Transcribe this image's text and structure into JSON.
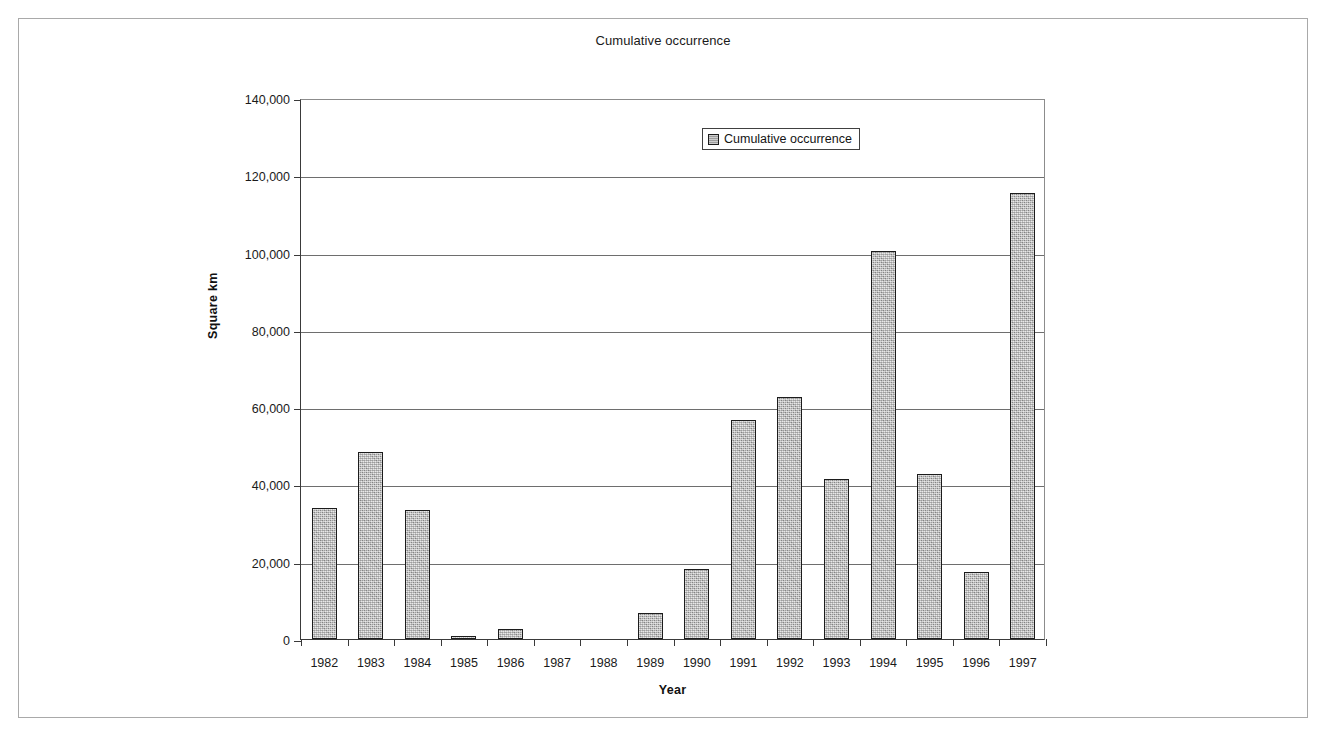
{
  "figure": {
    "title": "Cumulative occurrence"
  },
  "legend": {
    "position": "top-center",
    "entries": [
      {
        "label": "Cumulative occurrence",
        "swatch": "gray-textured-square"
      }
    ]
  },
  "axes": {
    "x_title": "Year",
    "y_title": "Square km"
  },
  "chart_data": {
    "type": "bar",
    "title": "Cumulative occurrence",
    "xlabel": "Year",
    "ylabel": "Square km",
    "series_name": "Cumulative occurrence",
    "grid": true,
    "legend_position": "top-center",
    "ylim": [
      0,
      140000
    ],
    "yticks": [
      0,
      20000,
      40000,
      60000,
      80000,
      100000,
      120000,
      140000
    ],
    "ytick_labels": [
      "0",
      "20,000",
      "40,000",
      "60,000",
      "80,000",
      "100,000",
      "120,000",
      "140,000"
    ],
    "categories": [
      "1982",
      "1983",
      "1984",
      "1985",
      "1986",
      "1987",
      "1988",
      "1989",
      "1990",
      "1991",
      "1992",
      "1993",
      "1994",
      "1995",
      "1996",
      "1997"
    ],
    "values": [
      34000,
      48500,
      33500,
      500,
      2500,
      0,
      0,
      6700,
      18000,
      56800,
      62500,
      41500,
      100500,
      42800,
      17300,
      115500
    ],
    "bar_color": "#b4b4b4",
    "bar_edge_color": "#1c1c1c"
  }
}
